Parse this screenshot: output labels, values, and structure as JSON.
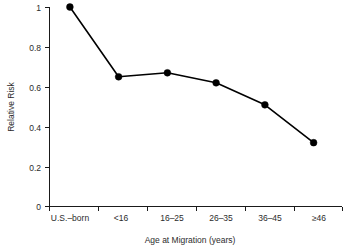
{
  "chart_data": {
    "type": "line",
    "title": "",
    "xlabel": "Age at Migration (years)",
    "ylabel": "Relative Risk",
    "categories": [
      "U.S.–born",
      "<16",
      "16–25",
      "26–35",
      "36–45",
      "≥46"
    ],
    "values": [
      1.0,
      0.65,
      0.67,
      0.62,
      0.51,
      0.32
    ],
    "series": [
      {
        "name": "Relative Risk",
        "values": [
          1.0,
          0.65,
          0.67,
          0.62,
          0.51,
          0.32
        ]
      }
    ],
    "ylim": [
      0,
      1
    ],
    "yticks": [
      0,
      0.2,
      0.4,
      0.6,
      0.8,
      1
    ],
    "ytick_labels": [
      "0",
      "0.2",
      "0.4",
      "0.6",
      "0.8",
      "1"
    ],
    "xtick_labels": [
      "U.S.–born",
      "<16",
      "16–25",
      "26–35",
      "36–45",
      "≥46"
    ],
    "grid": false,
    "legend": "none",
    "marker": "filled-circle",
    "line_color": "#000000",
    "marker_color": "#000000",
    "background_color": "#ffffff"
  }
}
